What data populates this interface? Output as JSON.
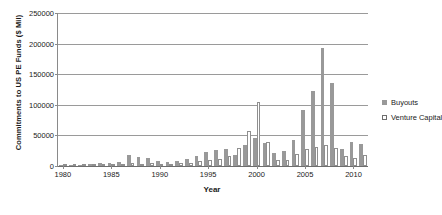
{
  "chart_data": {
    "type": "bar",
    "title": "",
    "xlabel": "Year",
    "ylabel": "Commitments to US PE Funds ($ Mil)",
    "ylim": [
      0,
      250000
    ],
    "ytick_labels": [
      "0",
      "50000",
      "100000",
      "150000",
      "200000",
      "250000"
    ],
    "ytick_values": [
      0,
      50000,
      100000,
      150000,
      200000,
      250000
    ],
    "xtick_labels": [
      "1980",
      "1985",
      "1990",
      "1995",
      "2000",
      "2005",
      "2010"
    ],
    "xtick_values": [
      1980,
      1985,
      1990,
      1995,
      2000,
      2005,
      2010
    ],
    "grid": true,
    "legend_position": "right",
    "categories": [
      1980,
      1981,
      1982,
      1983,
      1984,
      1985,
      1986,
      1987,
      1988,
      1989,
      1990,
      1991,
      1992,
      1993,
      1994,
      1995,
      1996,
      1997,
      1998,
      1999,
      2000,
      2001,
      2002,
      2003,
      2004,
      2005,
      2006,
      2007,
      2008,
      2009,
      2010,
      2011
    ],
    "series": [
      {
        "name": "Buyouts",
        "color": "#999999",
        "values": [
          1000,
          1500,
          1800,
          3000,
          4500,
          5000,
          6500,
          18000,
          14000,
          13000,
          9000,
          6000,
          8500,
          12000,
          17000,
          23000,
          26000,
          28000,
          18000,
          35000,
          45000,
          37000,
          21000,
          25000,
          43000,
          92000,
          122000,
          193000,
          135000,
          28000,
          40000,
          36000
        ]
      },
      {
        "name": "Venture Capital",
        "color": "#ffffff",
        "values": [
          600,
          900,
          1200,
          2800,
          3200,
          3000,
          3500,
          4500,
          4000,
          5000,
          3500,
          2000,
          4500,
          5000,
          7500,
          9500,
          11500,
          17000,
          30000,
          57000,
          105000,
          39000,
          10000,
          9500,
          19000,
          28000,
          31000,
          35000,
          29000,
          16000,
          13000,
          18000
        ]
      }
    ]
  },
  "legend": {
    "items": [
      {
        "label": "Buyouts"
      },
      {
        "label": "Venture Capital"
      }
    ]
  }
}
